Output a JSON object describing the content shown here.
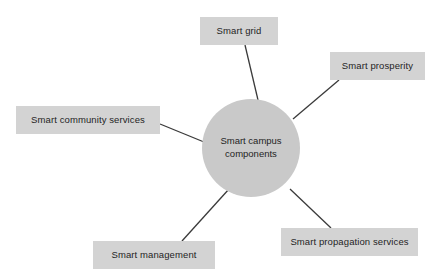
{
  "diagram": {
    "type": "hub-and-spoke mind map",
    "background_color": "#ffffff",
    "hub": {
      "line1": "Smart campus",
      "line2": "components",
      "fill_color": "#c9c9c9",
      "center_x": 251,
      "center_y": 148,
      "radius": 49
    },
    "node_fill_color": "#d3d3d3",
    "connector_color": "#3a3a3a",
    "nodes": [
      {
        "id": "smart-grid",
        "label": "Smart grid",
        "x": 200,
        "y": 17,
        "width": 78,
        "height": 28,
        "connector": {
          "x1": 245,
          "y1": 45,
          "x2": 258,
          "y2": 100
        }
      },
      {
        "id": "smart-prosperity",
        "label": "Smart prosperity",
        "x": 330,
        "y": 52,
        "width": 95,
        "height": 28,
        "connector": {
          "x1": 339,
          "y1": 80,
          "x2": 293,
          "y2": 119
        }
      },
      {
        "id": "smart-community-services",
        "label": "Smart community services",
        "x": 16,
        "y": 106,
        "width": 144,
        "height": 28,
        "connector": {
          "x1": 160,
          "y1": 124,
          "x2": 204,
          "y2": 142
        }
      },
      {
        "id": "smart-management",
        "label": "Smart management",
        "x": 93,
        "y": 241,
        "width": 122,
        "height": 28,
        "connector": {
          "x1": 182,
          "y1": 241,
          "x2": 229,
          "y2": 189
        }
      },
      {
        "id": "smart-propagation-services",
        "label": "Smart propagation services",
        "x": 281,
        "y": 228,
        "width": 137,
        "height": 28,
        "connector": {
          "x1": 331,
          "y1": 228,
          "x2": 290,
          "y2": 189
        }
      }
    ]
  }
}
